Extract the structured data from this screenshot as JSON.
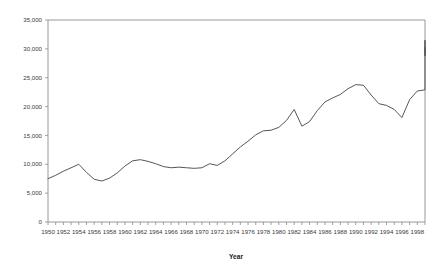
{
  "chart_data": {
    "type": "line",
    "title": "",
    "xlabel": "Year",
    "ylabel": "",
    "xlim": [
      1950,
      1999
    ],
    "ylim": [
      0,
      35000
    ],
    "grid": false,
    "legend": false,
    "y_ticks": [
      0,
      5000,
      10000,
      15000,
      20000,
      25000,
      30000,
      35000
    ],
    "y_tick_labels": [
      "0",
      "5,000",
      "10,000",
      "15,000",
      "20,000",
      "25,000",
      "30,000",
      "35,000"
    ],
    "x_tick_labels": [
      "1950",
      "1952",
      "1954",
      "1956",
      "1958",
      "1960",
      "1962",
      "1964",
      "1966",
      "1968",
      "1970",
      "1972",
      "1974",
      "1976",
      "1978",
      "1980",
      "1982",
      "1984",
      "1986",
      "1988",
      "1990",
      "1992",
      "1994",
      "1996",
      "1998"
    ],
    "x_tick_values": [
      1950,
      1952,
      1954,
      1956,
      1958,
      1960,
      1962,
      1964,
      1966,
      1968,
      1970,
      1972,
      1974,
      1976,
      1978,
      1980,
      1982,
      1984,
      1986,
      1988,
      1990,
      1992,
      1994,
      1996,
      1998
    ],
    "x_minor_interval": 1,
    "series": [
      {
        "name": "",
        "color": "#4d4d4d",
        "x": [
          1950,
          1951,
          1952,
          1953,
          1954,
          1955,
          1956,
          1957,
          1958,
          1959,
          1960,
          1961,
          1962,
          1963,
          1964,
          1965,
          1966,
          1967,
          1968,
          1969,
          1970,
          1971,
          1972,
          1973,
          1974,
          1975,
          1976,
          1977,
          1978,
          1979,
          1980,
          1981,
          1982,
          1983,
          1984,
          1985,
          1986,
          1987,
          1988,
          1989,
          1990,
          1991,
          1992,
          1993,
          1994,
          1995,
          1996,
          1997,
          1998,
          1999
        ],
        "values": [
          7500,
          8100,
          8800,
          9400,
          10000,
          8600,
          7400,
          7100,
          7600,
          8500,
          9700,
          10600,
          10800,
          10500,
          10100,
          9600,
          9400,
          9500,
          9400,
          9300,
          9400,
          10100,
          9800,
          10600,
          11800,
          13000,
          14000,
          15100,
          15800,
          15900,
          16400,
          17600,
          19500,
          16600,
          17400,
          19300,
          20800,
          21500,
          22100,
          23100,
          23800,
          23700,
          22000,
          20500,
          20200,
          19500,
          18100,
          21200,
          22700,
          22900
        ]
      }
    ],
    "series_tail": {
      "x": [
        1999.2,
        1999.8,
        2000.6,
        2001.4,
        2002.2
      ],
      "values": [
        26500,
        31500,
        31200,
        28800,
        30200
      ]
    }
  },
  "axes": {
    "plot_left_px": 48,
    "plot_right_px": 425,
    "plot_top_px": 20,
    "plot_bottom_px": 222
  }
}
